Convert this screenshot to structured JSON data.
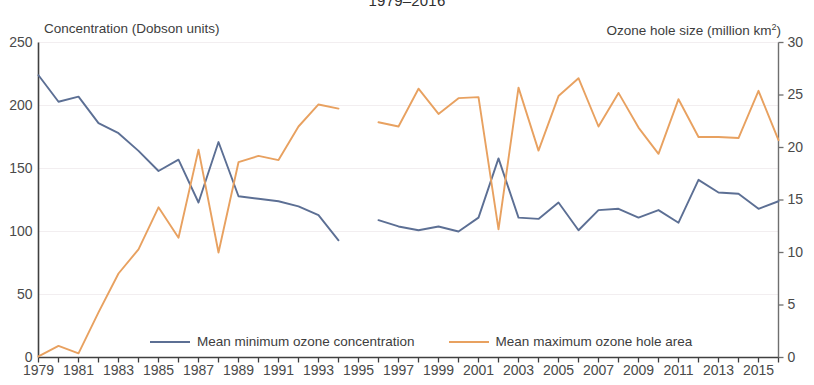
{
  "chart_data": {
    "type": "line",
    "title": "1979–2016",
    "xlabel": "",
    "ylabel": "Concentration (Dobson units)",
    "y2label": "Ozone hole size (million km²)",
    "grid": true,
    "legend_position": "bottom",
    "xlim": [
      1979,
      2016
    ],
    "ylim": [
      0,
      250
    ],
    "y2lim": [
      0,
      30
    ],
    "y_ticks": [
      0,
      50,
      100,
      150,
      200,
      250
    ],
    "y2_ticks": [
      0,
      5,
      10,
      15,
      20,
      25,
      30
    ],
    "x_tick_labels": [
      "1979",
      "1981",
      "1983",
      "1985",
      "1987",
      "1989",
      "1991",
      "1993",
      "1995",
      "1997",
      "1999",
      "2001",
      "2003",
      "2005",
      "2007",
      "2009",
      "2011",
      "2013",
      "2015"
    ],
    "x_minor_ticks_all_years": true,
    "x": [
      1979,
      1980,
      1981,
      1982,
      1983,
      1984,
      1985,
      1986,
      1987,
      1988,
      1989,
      1990,
      1991,
      1992,
      1993,
      1994,
      1995,
      1996,
      1997,
      1998,
      1999,
      2000,
      2001,
      2002,
      2003,
      2004,
      2005,
      2006,
      2007,
      2008,
      2009,
      2010,
      2011,
      2012,
      2013,
      2014,
      2015,
      2016
    ],
    "series": [
      {
        "name": "Mean minimum ozone concentration",
        "axis": "left",
        "unit": "Dobson units",
        "color": "#5c6f94",
        "values": [
          224,
          203,
          207,
          186,
          178,
          164,
          148,
          157,
          123,
          171,
          128,
          126,
          124,
          120,
          113,
          93,
          null,
          109,
          104,
          101,
          104,
          100,
          111,
          158,
          111,
          110,
          123,
          101,
          117,
          118,
          111,
          117,
          107,
          141,
          131,
          130,
          118,
          124
        ]
      },
      {
        "name": "Mean maximum ozone hole area",
        "axis": "right",
        "unit": "million km²",
        "color": "#e8a160",
        "values": [
          0.1,
          1.1,
          0.4,
          4.3,
          8.0,
          10.3,
          14.3,
          11.4,
          19.8,
          10.0,
          18.6,
          19.2,
          18.8,
          22.0,
          24.1,
          23.7,
          null,
          22.4,
          22.0,
          25.6,
          23.2,
          24.7,
          24.8,
          12.2,
          25.7,
          19.7,
          24.9,
          26.6,
          22.0,
          25.2,
          21.9,
          19.4,
          24.6,
          21.0,
          21.0,
          20.9,
          25.4,
          20.7
        ]
      }
    ]
  },
  "legend": {
    "entries": [
      {
        "label": "Mean minimum ozone concentration",
        "color": "#5c6f94"
      },
      {
        "label": "Mean maximum ozone hole area",
        "color": "#e8a160"
      }
    ]
  }
}
